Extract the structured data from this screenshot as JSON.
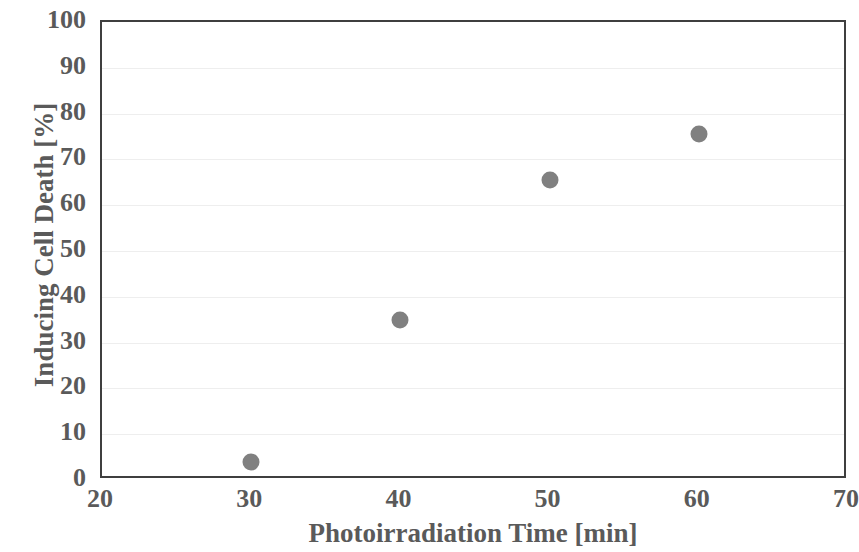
{
  "chart_data": {
    "type": "scatter",
    "title": "",
    "xlabel": "Photoirradiation Time [min]",
    "ylabel": "Inducing Cell Death [%]",
    "xlim": [
      20,
      70
    ],
    "ylim": [
      0,
      100
    ],
    "xticks": [
      20,
      30,
      40,
      50,
      60,
      70
    ],
    "yticks": [
      0,
      10,
      20,
      30,
      40,
      50,
      60,
      70,
      80,
      90,
      100
    ],
    "xtick_labels": [
      "20",
      "30",
      "40",
      "50",
      "60",
      "70"
    ],
    "ytick_labels": [
      "0",
      "10",
      "20",
      "30",
      "40",
      "50",
      "60",
      "70",
      "80",
      "90",
      "100"
    ],
    "grid": true,
    "grid_axis": "y",
    "legend": null,
    "marker_color": "#808080",
    "marker_shape": "circle",
    "axis_color": "#3f3f3f",
    "text_color": "#5a5a5a",
    "gridline_color": "#eeeeee",
    "x": [
      30,
      40,
      50,
      60
    ],
    "values": [
      4,
      35,
      65.5,
      75.5
    ],
    "points": [
      {
        "x": 30,
        "y": 4
      },
      {
        "x": 40,
        "y": 35
      },
      {
        "x": 50,
        "y": 65.5
      },
      {
        "x": 60,
        "y": 75.5
      }
    ],
    "series": [
      {
        "name": "Inducing Cell Death",
        "points": [
          {
            "x": 30,
            "y": 4
          },
          {
            "x": 40,
            "y": 35
          },
          {
            "x": 50,
            "y": 65.5
          },
          {
            "x": 60,
            "y": 75.5
          }
        ]
      }
    ]
  }
}
